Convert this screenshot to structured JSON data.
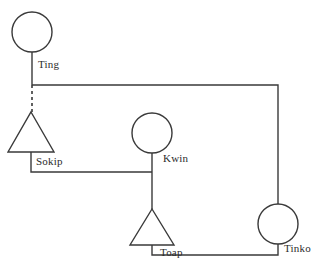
{
  "diagram": {
    "type": "kinship-chart",
    "background_color": "#ffffff",
    "line_color": "#3a3a3a",
    "label_color": "#2b2b2b",
    "canvas": {
      "width": 324,
      "height": 274
    },
    "shape_legend": {
      "circle": "female",
      "triangle": "male"
    },
    "nodes": [
      {
        "id": "ting",
        "label": "Ting",
        "shape": "circle",
        "cx": 32,
        "cy": 32,
        "r": 20,
        "label_x": 38,
        "label_y": 58
      },
      {
        "id": "sokip",
        "label": "Sokip",
        "shape": "triangle",
        "cx": 31,
        "apex_y": 112,
        "base_y": 152,
        "half_width": 23,
        "label_x": 36,
        "label_y": 155
      },
      {
        "id": "kwin",
        "label": "Kwin",
        "shape": "circle",
        "cx": 152,
        "cy": 133,
        "r": 20,
        "label_x": 163,
        "label_y": 152
      },
      {
        "id": "toap",
        "label": "Toap",
        "shape": "triangle",
        "cx": 152,
        "apex_y": 209,
        "base_y": 245,
        "half_width": 22,
        "label_x": 160,
        "label_y": 246
      },
      {
        "id": "tinko",
        "label": "Tinko",
        "shape": "circle",
        "cx": 278,
        "cy": 224,
        "r": 20,
        "label_x": 284,
        "label_y": 242
      }
    ],
    "edges": [
      {
        "id": "ting-descent-stem",
        "style": "solid",
        "points": "32,52 32,85"
      },
      {
        "id": "ting-to-tinko-sibling-bar",
        "style": "solid",
        "points": "32,85 278,85 278,204"
      },
      {
        "id": "ting-to-sokip-marriage",
        "style": "dashed",
        "points": "32,85 32,112"
      },
      {
        "id": "sokip-to-kwin-descent",
        "style": "solid",
        "points": "31,152 31,172 152,172"
      },
      {
        "id": "kwin-stem",
        "style": "solid",
        "points": "152,153 152,209"
      },
      {
        "id": "toap-to-tinko-link",
        "style": "solid",
        "points": "152,245 152,255 278,255 278,244"
      }
    ]
  }
}
